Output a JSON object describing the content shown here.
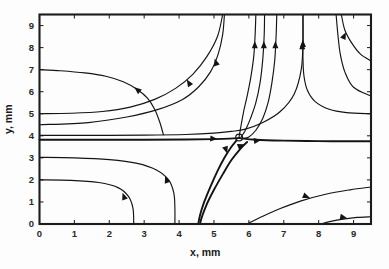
{
  "chart_data": {
    "type": "line",
    "subtype": "streamline-phase-portrait",
    "title": "",
    "xlabel": "x, mm",
    "ylabel": "y, mm",
    "xlim": [
      0,
      9.5
    ],
    "ylim": [
      0,
      9.5
    ],
    "xticks": [
      0,
      1,
      2,
      3,
      4,
      5,
      6,
      7,
      8,
      9
    ],
    "yticks": [
      0,
      1,
      2,
      3,
      4,
      5,
      6,
      7,
      8,
      9
    ],
    "xticklabels": [
      "0",
      "1",
      "2",
      "3",
      "4",
      "5",
      "6",
      "7",
      "8",
      "9"
    ],
    "yticklabels": [
      "0",
      "1",
      "2",
      "3",
      "4",
      "5",
      "6",
      "7",
      "8",
      "9"
    ],
    "grid": false,
    "legend": null,
    "frame": "box",
    "line_color": "#141414",
    "background_color": "#fdfdfd",
    "critical_points": [
      {
        "name": "saddle-point-marker",
        "x": 5.72,
        "y": 3.92,
        "marker": "open-circle"
      }
    ],
    "annotations": [],
    "series": [
      {
        "name": "streamline-upper-left-outer",
        "points": [
          [
            0.0,
            7.0
          ],
          [
            0.6,
            6.95
          ],
          [
            1.3,
            6.85
          ],
          [
            1.9,
            6.7
          ],
          [
            2.4,
            6.45
          ],
          [
            2.8,
            6.1
          ],
          [
            3.1,
            5.7
          ],
          [
            3.3,
            5.2
          ],
          [
            3.45,
            4.6
          ],
          [
            3.55,
            4.05
          ]
        ],
        "arrows": [
          {
            "x": 2.72,
            "y": 6.2,
            "angle": -140
          }
        ]
      },
      {
        "name": "streamline-upper-left-to-top",
        "points": [
          [
            0.0,
            5.0
          ],
          [
            0.9,
            5.02
          ],
          [
            1.8,
            5.1
          ],
          [
            2.6,
            5.3
          ],
          [
            3.3,
            5.65
          ],
          [
            3.9,
            6.15
          ],
          [
            4.4,
            6.8
          ],
          [
            4.8,
            7.6
          ],
          [
            5.1,
            8.5
          ],
          [
            5.25,
            9.5
          ]
        ],
        "arrows": [
          {
            "x": 4.22,
            "y": 6.55,
            "angle": -122
          }
        ]
      },
      {
        "name": "streamline-near-horizontal-upper",
        "points": [
          [
            0.0,
            4.02
          ],
          [
            1.5,
            4.02
          ],
          [
            3.0,
            4.03
          ],
          [
            4.2,
            4.06
          ],
          [
            5.0,
            4.12
          ],
          [
            5.5,
            4.2
          ],
          [
            5.9,
            4.3
          ],
          [
            6.4,
            4.6
          ],
          [
            6.9,
            5.1
          ],
          [
            7.3,
            5.9
          ],
          [
            7.5,
            7.0
          ],
          [
            7.55,
            8.2
          ],
          [
            7.55,
            9.5
          ]
        ],
        "arrows": [
          {
            "x": 7.53,
            "y": 8.25,
            "angle": -90
          }
        ]
      },
      {
        "name": "streamline-separatrix-horizontal",
        "points": [
          [
            0.0,
            3.82
          ],
          [
            1.5,
            3.82
          ],
          [
            3.0,
            3.82
          ],
          [
            4.2,
            3.83
          ],
          [
            5.0,
            3.85
          ],
          [
            5.45,
            3.87
          ],
          [
            5.72,
            3.9
          ]
        ],
        "arrows": [
          {
            "x": 5.1,
            "y": 3.85,
            "angle": 5
          }
        ]
      },
      {
        "name": "streamline-separatrix-right",
        "points": [
          [
            5.72,
            3.9
          ],
          [
            6.2,
            3.82
          ],
          [
            7.0,
            3.78
          ],
          [
            8.0,
            3.76
          ],
          [
            9.0,
            3.75
          ],
          [
            9.5,
            3.75
          ]
        ],
        "arrows": [
          {
            "x": 6.35,
            "y": 3.81,
            "angle": -8
          }
        ]
      },
      {
        "name": "streamline-from-top-x62",
        "points": [
          [
            6.2,
            9.5
          ],
          [
            6.18,
            8.6
          ],
          [
            6.14,
            7.6
          ],
          [
            6.05,
            6.6
          ],
          [
            5.95,
            5.8
          ],
          [
            5.85,
            5.1
          ],
          [
            5.78,
            4.5
          ],
          [
            5.72,
            3.95
          ]
        ],
        "arrows": [
          {
            "x": 6.17,
            "y": 8.3,
            "angle": -90
          }
        ]
      },
      {
        "name": "streamline-from-top-x64",
        "points": [
          [
            6.45,
            9.5
          ],
          [
            6.44,
            8.6
          ],
          [
            6.4,
            7.5
          ],
          [
            6.32,
            6.4
          ],
          [
            6.2,
            5.5
          ],
          [
            6.05,
            4.8
          ],
          [
            5.9,
            4.25
          ],
          [
            5.78,
            3.95
          ]
        ],
        "arrows": [
          {
            "x": 6.43,
            "y": 8.3,
            "angle": -90
          }
        ]
      },
      {
        "name": "streamline-from-top-x68",
        "points": [
          [
            6.8,
            9.5
          ],
          [
            6.78,
            8.5
          ],
          [
            6.74,
            7.4
          ],
          [
            6.66,
            6.4
          ],
          [
            6.55,
            5.5
          ],
          [
            6.4,
            4.8
          ],
          [
            6.2,
            4.25
          ],
          [
            6.0,
            3.95
          ],
          [
            5.82,
            3.88
          ]
        ],
        "arrows": [
          {
            "x": 6.76,
            "y": 8.3,
            "angle": -90
          }
        ]
      },
      {
        "name": "streamline-from-top-x53",
        "points": [
          [
            5.3,
            9.5
          ],
          [
            5.25,
            8.6
          ],
          [
            5.12,
            7.7
          ],
          [
            4.9,
            6.9
          ],
          [
            4.55,
            6.2
          ],
          [
            4.1,
            5.65
          ],
          [
            3.4,
            5.2
          ],
          [
            2.5,
            4.85
          ],
          [
            1.4,
            4.6
          ],
          [
            0.0,
            4.5
          ]
        ],
        "arrows": [
          {
            "x": 5.02,
            "y": 7.5,
            "angle": -108
          }
        ]
      },
      {
        "name": "streamline-right-from-top-x75",
        "points": [
          [
            7.55,
            9.5
          ],
          [
            7.55,
            8.5
          ],
          [
            7.55,
            7.5
          ],
          [
            7.58,
            6.7
          ],
          [
            7.68,
            6.05
          ],
          [
            7.9,
            5.55
          ],
          [
            8.3,
            5.2
          ],
          [
            8.8,
            5.05
          ],
          [
            9.5,
            5.0
          ]
        ],
        "arrows": [
          {
            "x": 7.55,
            "y": 8.35,
            "angle": -90
          }
        ]
      },
      {
        "name": "streamline-right-from-top-x86",
        "points": [
          [
            8.65,
            9.5
          ],
          [
            8.75,
            8.8
          ],
          [
            8.95,
            8.2
          ],
          [
            9.2,
            7.7
          ],
          [
            9.5,
            7.4
          ]
        ],
        "arrows": [
          {
            "x": 8.78,
            "y": 8.7,
            "angle": -65
          }
        ]
      },
      {
        "name": "streamline-right-inner-corner",
        "points": [
          [
            8.5,
            9.5
          ],
          [
            8.55,
            8.6
          ],
          [
            8.62,
            7.7
          ],
          [
            8.75,
            6.9
          ],
          [
            9.0,
            6.2
          ],
          [
            9.5,
            5.8
          ]
        ],
        "arrows": []
      },
      {
        "name": "streamline-lower-left-y3",
        "points": [
          [
            0.0,
            3.02
          ],
          [
            1.0,
            3.0
          ],
          [
            2.0,
            2.92
          ],
          [
            2.8,
            2.75
          ],
          [
            3.35,
            2.45
          ],
          [
            3.7,
            2.0
          ],
          [
            3.85,
            1.4
          ],
          [
            3.88,
            0.7
          ],
          [
            3.88,
            0.0
          ]
        ],
        "arrows": [
          {
            "x": 3.6,
            "y": 2.18,
            "angle": 250
          }
        ]
      },
      {
        "name": "streamline-lower-left-y2",
        "points": [
          [
            0.0,
            2.0
          ],
          [
            0.9,
            1.98
          ],
          [
            1.7,
            1.88
          ],
          [
            2.25,
            1.65
          ],
          [
            2.55,
            1.25
          ],
          [
            2.68,
            0.7
          ],
          [
            2.7,
            0.0
          ]
        ],
        "arrows": [
          {
            "x": 2.38,
            "y": 1.42,
            "angle": 250
          }
        ]
      },
      {
        "name": "streamline-separatrix-down-left",
        "points": [
          [
            5.65,
            3.8
          ],
          [
            5.5,
            3.5
          ],
          [
            5.3,
            3.0
          ],
          [
            5.1,
            2.4
          ],
          [
            4.9,
            1.7
          ],
          [
            4.72,
            1.0
          ],
          [
            4.6,
            0.4
          ],
          [
            4.55,
            0.0
          ]
        ],
        "arrows": [
          {
            "x": 5.38,
            "y": 3.2,
            "angle": 72
          }
        ]
      },
      {
        "name": "streamline-separatrix-down-right",
        "points": [
          [
            5.95,
            3.72
          ],
          [
            5.75,
            3.4
          ],
          [
            5.5,
            2.9
          ],
          [
            5.25,
            2.25
          ],
          [
            5.0,
            1.55
          ],
          [
            4.78,
            0.85
          ],
          [
            4.65,
            0.3
          ],
          [
            4.6,
            0.0
          ]
        ],
        "arrows": [
          {
            "x": 5.88,
            "y": 3.62,
            "angle": -22
          }
        ]
      },
      {
        "name": "streamline-bottom-right-x6",
        "points": [
          [
            5.95,
            0.0
          ],
          [
            6.4,
            0.35
          ],
          [
            6.9,
            0.7
          ],
          [
            7.5,
            1.05
          ],
          [
            8.2,
            1.35
          ],
          [
            8.9,
            1.55
          ],
          [
            9.5,
            1.68
          ]
        ],
        "arrows": [
          {
            "x": 7.75,
            "y": 1.18,
            "angle": 22
          }
        ]
      },
      {
        "name": "streamline-bottom-right-x8",
        "points": [
          [
            8.05,
            0.0
          ],
          [
            8.35,
            0.12
          ],
          [
            8.7,
            0.22
          ],
          [
            9.1,
            0.3
          ],
          [
            9.5,
            0.33
          ]
        ],
        "arrows": [
          {
            "x": 8.82,
            "y": 0.26,
            "angle": 12
          }
        ]
      }
    ]
  },
  "axes": {
    "x_title": "x, mm",
    "y_title": "y, mm"
  }
}
